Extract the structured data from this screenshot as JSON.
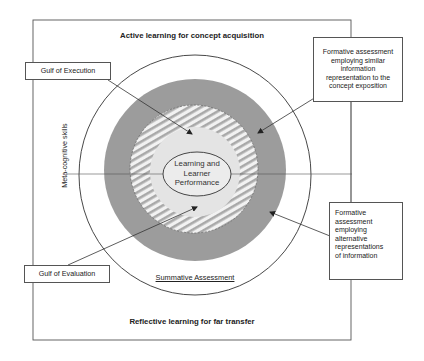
{
  "diagram": {
    "title_top": "Active learning for concept acquisition",
    "title_bottom": "Reflective learning for far transfer",
    "vertical_axis_label": "Meta-cognitive skills",
    "center_label": "Learning and Learner Performance",
    "center_label_lines": [
      "Learning and",
      "Learner",
      "Performance"
    ],
    "outer_ring_label": "Summative Assessment",
    "callouts": {
      "gulf_execution": "Gulf of Execution",
      "gulf_evaluation": "Gulf of Evaluation",
      "formative_similar": "Formative assessment employing similar information representation to the concept exposition",
      "formative_similar_lines": [
        "Formative assessment",
        "employing similar",
        "information",
        "representation to the",
        "concept exposition"
      ],
      "formative_alternative": "Formative assessment employing alternative representations of information",
      "formative_alternative_lines": [
        "Formative",
        "assessment",
        "employing",
        "alternative",
        "representations",
        "of information"
      ]
    },
    "layers": [
      {
        "name": "summative-assessment-circle",
        "fill": "#ffffff",
        "stroke": "#333333"
      },
      {
        "name": "formative-alternative-ring",
        "fill": "#9a9a9a"
      },
      {
        "name": "formative-similar-ring",
        "fill": "hatched",
        "stroke": "#666666"
      },
      {
        "name": "learning-core",
        "fill": "#e6e6e6"
      },
      {
        "name": "performance-ellipse",
        "fill": "#ededed",
        "stroke": "#333333"
      }
    ],
    "colors": {
      "gray_ring": "#9c9c9c",
      "hatch_light": "#f2f2f2",
      "hatch_dark": "#a8a8a8",
      "core": "#e4e4e4",
      "line": "#333333"
    }
  }
}
